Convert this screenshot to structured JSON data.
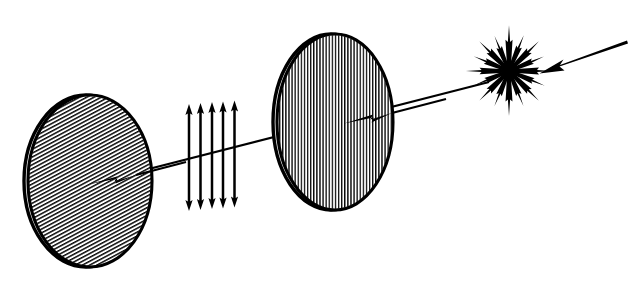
{
  "figure": {
    "width": 629,
    "height": 282,
    "background_color": "#ffffff",
    "ink_color": "#000000",
    "hatch_color": "#111111"
  },
  "elements": {
    "source_beam": {
      "label": "incident-unpolarized-beam",
      "x1": 625,
      "y1": 42,
      "x2": 538,
      "y2": 74,
      "arrow_at": "end",
      "direction": "left-down"
    },
    "starburst": {
      "label": "unpolarized-light-starburst",
      "cx": 509,
      "cy": 71,
      "ray_count": 16,
      "ray_length_major": 46,
      "ray_length_minor": 38,
      "description": "radial double-sided arrows denoting random transverse vibration directions"
    },
    "main_ray": {
      "label": "optical-axis-ray",
      "x1": 487,
      "y1": 83,
      "x2": 88,
      "y2": 184,
      "arrow_positions": [
        {
          "x": 345,
          "y": 123,
          "name": "arrowhead-at-second-filter"
        },
        {
          "x": 89,
          "y": 184,
          "name": "arrowhead-at-first-filter"
        }
      ]
    },
    "polarizer_disc": {
      "label": "vertical-polarizer-disc",
      "cx": 335,
      "cy": 122,
      "rx": 58,
      "ry": 88,
      "hatch_orientation": "vertical",
      "hatch_angle_deg": 90,
      "hatch_spacing": 3.1,
      "rim_style": "double-outline-left-edge"
    },
    "polarized_beam": {
      "label": "linearly-polarized-beam-arrows",
      "arrow_count": 5,
      "orientation": "vertical",
      "double_headed": true,
      "x_positions": [
        189,
        200,
        211,
        222,
        234
      ],
      "top_y": 103,
      "bottom_y": 212
    },
    "analyzer_disc": {
      "label": "tilted-analyzer-disc",
      "cx": 90,
      "cy": 181,
      "rx": 62,
      "ry": 86,
      "hatch_orientation": "diagonal",
      "hatch_angle_deg": 28,
      "hatch_spacing": 3.4,
      "rim_style": "double-outline-left-edge"
    }
  },
  "reading_order": [
    "incident-unpolarized-beam",
    "unpolarized-light-starburst",
    "vertical-polarizer-disc",
    "linearly-polarized-beam-arrows",
    "tilted-analyzer-disc"
  ]
}
